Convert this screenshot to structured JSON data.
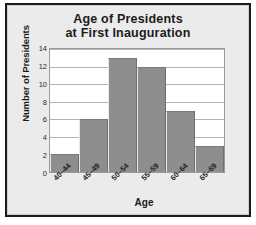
{
  "chart_data": {
    "type": "bar",
    "title": "Age of Presidents at First Inauguration",
    "title_line1": "Age of Presidents",
    "title_line2": "at First Inauguration",
    "xlabel": "Age",
    "ylabel": "Number of Presidents",
    "categories": [
      "40–44",
      "45–49",
      "50–54",
      "55–59",
      "60–64",
      "65–69"
    ],
    "values": [
      2,
      6,
      13,
      12,
      7,
      3
    ],
    "ylim": [
      0,
      14
    ],
    "yticks": [
      0,
      2,
      4,
      6,
      8,
      10,
      12,
      14
    ],
    "ytick_labels": [
      "0",
      "2",
      "4",
      "6",
      "8",
      "10",
      "12",
      "14"
    ],
    "grid": true,
    "legend": null,
    "bar_color": "#8e8e8e",
    "plot_background": "#ffffff",
    "figure_background": "#ebebeb",
    "text_color": "#1b1b1b"
  }
}
